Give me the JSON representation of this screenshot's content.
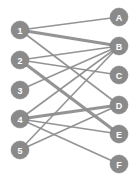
{
  "figure": {
    "width": 139,
    "height": 185,
    "background_color": "#ffffff",
    "node_color": "#8a8a8a",
    "node_label_color": "#ffffff",
    "edge_color": "#8e8e8e",
    "node_radius": 9
  },
  "chart_data": {
    "type": "diagram",
    "subtype": "bipartite-graph",
    "grid": false,
    "legend": null,
    "left_set_label": "1-5",
    "right_set_label": "A-F",
    "nodes": [
      {
        "id": "1",
        "label": "1",
        "side": "left",
        "x": 20,
        "y": 30
      },
      {
        "id": "2",
        "label": "2",
        "side": "left",
        "x": 20,
        "y": 60
      },
      {
        "id": "3",
        "label": "3",
        "side": "left",
        "x": 20,
        "y": 90
      },
      {
        "id": "4",
        "label": "4",
        "side": "left",
        "x": 20,
        "y": 119
      },
      {
        "id": "5",
        "label": "5",
        "side": "left",
        "x": 20,
        "y": 150
      },
      {
        "id": "A",
        "label": "A",
        "side": "right",
        "x": 119,
        "y": 17
      },
      {
        "id": "B",
        "label": "B",
        "side": "right",
        "x": 119,
        "y": 46
      },
      {
        "id": "C",
        "label": "C",
        "side": "right",
        "x": 119,
        "y": 75
      },
      {
        "id": "D",
        "label": "D",
        "side": "right",
        "x": 119,
        "y": 105
      },
      {
        "id": "E",
        "label": "E",
        "side": "right",
        "x": 119,
        "y": 134
      },
      {
        "id": "F",
        "label": "F",
        "side": "right",
        "x": 119,
        "y": 164
      }
    ],
    "edges": [
      {
        "source": "1",
        "target": "A",
        "width": 1.6
      },
      {
        "source": "1",
        "target": "B",
        "width": 3.2
      },
      {
        "source": "1",
        "target": "D",
        "width": 1.6
      },
      {
        "source": "2",
        "target": "B",
        "width": 1.6
      },
      {
        "source": "2",
        "target": "C",
        "width": 1.6
      },
      {
        "source": "2",
        "target": "E",
        "width": 3.2
      },
      {
        "source": "3",
        "target": "B",
        "width": 1.6
      },
      {
        "source": "4",
        "target": "B",
        "width": 1.6
      },
      {
        "source": "4",
        "target": "D",
        "width": 3.2
      },
      {
        "source": "4",
        "target": "E",
        "width": 1.6
      },
      {
        "source": "4",
        "target": "F",
        "width": 1.6
      },
      {
        "source": "5",
        "target": "B",
        "width": 1.6
      },
      {
        "source": "5",
        "target": "D",
        "width": 1.6
      }
    ]
  }
}
